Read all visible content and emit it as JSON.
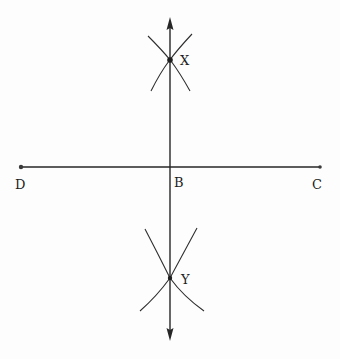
{
  "diagram": {
    "colors": {
      "ink": "#262626",
      "background": "#fdfdfd"
    },
    "points": [
      {
        "id": "X",
        "label": "X",
        "x": 170,
        "y": 60
      },
      {
        "id": "Y",
        "label": "Y",
        "x": 170,
        "y": 278
      },
      {
        "id": "B",
        "label": "B",
        "x": 170,
        "y": 167
      },
      {
        "id": "D",
        "label": "D",
        "x": 21,
        "y": 167
      },
      {
        "id": "C",
        "label": "C",
        "x": 320,
        "y": 167
      }
    ],
    "segments": [
      {
        "from": "D",
        "to": "C",
        "type": "line-segment"
      },
      {
        "from": "top-arrow",
        "to": "bottom-arrow",
        "type": "line-with-arrows",
        "through": [
          "X",
          "B",
          "Y"
        ]
      }
    ],
    "arcs": [
      {
        "near": "X",
        "count": 2
      },
      {
        "near": "Y",
        "count": 2
      }
    ],
    "labels": {
      "x": "X",
      "y": "Y",
      "b": "B",
      "d": "D",
      "c": "C"
    }
  }
}
